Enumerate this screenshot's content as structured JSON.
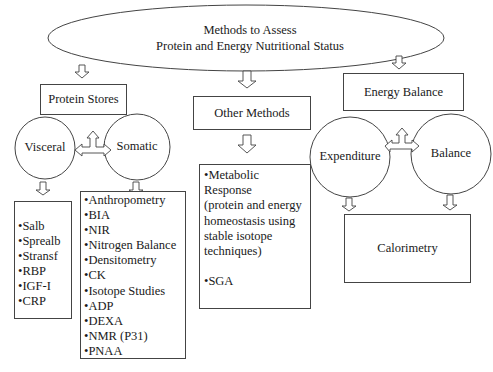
{
  "title": {
    "line1": "Methods to Assess",
    "line2": "Protein and Energy Nutritional Status"
  },
  "branches": {
    "protein_stores": {
      "label": "Protein Stores",
      "visceral": {
        "label": "Visceral",
        "items": [
          "•Salb",
          "•Sprealb",
          "•Stransf",
          "•RBP",
          "•IGF-I",
          "•CRP"
        ]
      },
      "somatic": {
        "label": "Somatic",
        "items": [
          "•Anthropometry",
          "•BIA",
          "•NIR",
          "•Nitrogen Balance",
          "•Densitometry",
          "•CK",
          "•Isotope Studies",
          "•ADP",
          "•DEXA",
          "•NMR (P31)",
          "•PNAA"
        ]
      }
    },
    "other_methods": {
      "label": "Other Methods",
      "items": [
        "•Metabolic Response",
        "(protein and energy",
        "homeostasis using",
        "stable isotope",
        "techniques)",
        "",
        "•SGA"
      ]
    },
    "energy_balance": {
      "label": "Energy Balance",
      "expenditure": {
        "label": "Expenditure"
      },
      "balance": {
        "label": "Balance"
      },
      "result": "Calorimetry"
    }
  },
  "colors": {
    "stroke": "#444444",
    "text": "#1a1a1a",
    "background": "#ffffff"
  }
}
